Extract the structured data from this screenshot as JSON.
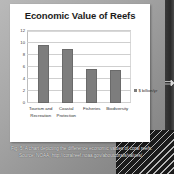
{
  "chart_data": {
    "type": "bar",
    "title": "Economic Value of Reefs",
    "categories": [
      "Tourism and Recreation",
      "Coastal Protection",
      "Fisheries",
      "Biodiversity"
    ],
    "values": [
      9.6,
      9.0,
      5.7,
      5.5
    ],
    "series": [
      {
        "name": "$ billion/yr",
        "values": [
          9.6,
          9.0,
          5.7,
          5.5
        ]
      }
    ],
    "xlabel": "",
    "ylabel": "",
    "ylim": [
      0,
      12
    ],
    "yticks": [
      0,
      2,
      4,
      6,
      8,
      10,
      12
    ],
    "ytick_labels": [
      "0",
      "2",
      "4",
      "6",
      "8",
      "10",
      "12"
    ],
    "grid": true,
    "legend": {
      "position": "right",
      "entries": [
        {
          "label": "$ billion/yr",
          "color": "#7d7d7d"
        }
      ]
    },
    "bar_color": "#7d7d7d"
  },
  "caption": {
    "line1": "Fig. 5: A chart depicting the difference economic values of coral reefs.",
    "line2": "Source: NOAA, http://coralreef.noaa.gov/aboutcorals/values/"
  },
  "colors": {
    "bar": "#7d7d7d",
    "card_background": "#ffffff",
    "page_background": "#a6a6a6",
    "caption_text": "#e8e8e8",
    "grid": "#cfcfcf"
  }
}
